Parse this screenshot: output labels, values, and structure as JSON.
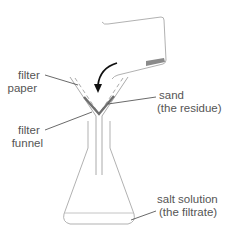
{
  "labels": {
    "filter_paper": [
      "filter",
      "paper"
    ],
    "filter_funnel": [
      "filter",
      "funnel"
    ],
    "sand": [
      "sand",
      "(the residue)"
    ],
    "salt_solution": [
      "salt solution",
      "(the filtrate)"
    ]
  },
  "colors": {
    "outline": "#9a9a9a",
    "text": "#555555",
    "leader": "#444444",
    "arrow": "#111111",
    "sand": "#6e6e6e"
  }
}
